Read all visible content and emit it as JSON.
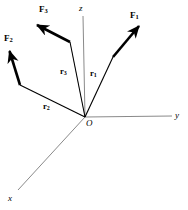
{
  "figure": {
    "type": "vector-diagram",
    "background_color": "#ffffff",
    "width": 188,
    "height": 210,
    "origin": {
      "label": "O",
      "x": 85,
      "y": 117
    },
    "axis_color": "#8a8a8a",
    "vector_color": "#000000",
    "axes": [
      {
        "name": "z-axis",
        "label": "z",
        "from": [
          85,
          117
        ],
        "to": [
          83,
          16
        ],
        "label_x": 79,
        "label_y": 4
      },
      {
        "name": "y-axis",
        "label": "y",
        "from": [
          85,
          117
        ],
        "to": [
          172,
          116
        ],
        "label_x": 175,
        "label_y": 111
      },
      {
        "name": "x-axis",
        "label": "x",
        "from": [
          85,
          117
        ],
        "to": [
          18,
          190
        ],
        "label_x": 8,
        "label_y": 194
      }
    ],
    "position_vectors": [
      {
        "name": "r1",
        "base": "r",
        "subscript": "1",
        "from": [
          85,
          117
        ],
        "to": [
          113,
          57
        ],
        "label_x": 90,
        "label_y": 69
      },
      {
        "name": "r2",
        "base": "r",
        "subscript": "2",
        "from": [
          85,
          117
        ],
        "to": [
          20,
          85
        ],
        "label_x": 43,
        "label_y": 102
      },
      {
        "name": "r3",
        "base": "r",
        "subscript": "3",
        "from": [
          85,
          117
        ],
        "to": [
          70,
          42
        ],
        "label_x": 60,
        "label_y": 67
      }
    ],
    "force_vectors": [
      {
        "name": "F1",
        "base": "F",
        "subscript": "1",
        "from": [
          113,
          57
        ],
        "to": [
          142,
          23
        ],
        "label_x": 130,
        "label_y": 11
      },
      {
        "name": "F2",
        "base": "F",
        "subscript": "2",
        "from": [
          20,
          85
        ],
        "to": [
          8,
          46
        ],
        "label_x": 4,
        "label_y": 34
      },
      {
        "name": "F3",
        "base": "F",
        "subscript": "3",
        "from": [
          70,
          42
        ],
        "to": [
          33,
          22
        ],
        "label_x": 39,
        "label_y": 5
      }
    ]
  }
}
